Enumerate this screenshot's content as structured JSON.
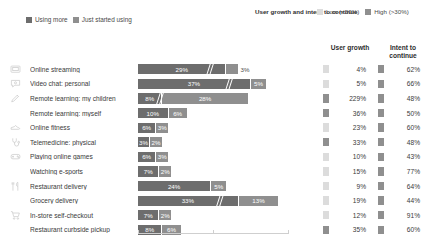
{
  "legend_left": {
    "items": [
      {
        "label": "Using more",
        "color": "#6d6d6d"
      },
      {
        "label": "Just started using",
        "color": "#8f8f8f"
      }
    ]
  },
  "legend_right": {
    "title": "User growth and intent to continue",
    "items": [
      {
        "label": "Low (<30%)",
        "color": "#dcdcdc"
      },
      {
        "label": "High (>30%)",
        "color": "#8f8f8f"
      }
    ]
  },
  "columns": {
    "growth_header": "User growth",
    "intent_header": "Intent to continue"
  },
  "chart_data": {
    "type": "bar",
    "title": "",
    "subtitle": "",
    "xlabel": "",
    "ylabel": "",
    "grid": false,
    "legend_position": "top-left",
    "orientation": "horizontal",
    "stacked": true,
    "axis_break": true,
    "series": [
      {
        "name": "Using more",
        "color": "#6d6d6d"
      },
      {
        "name": "Just started using",
        "color": "#8f8f8f"
      }
    ],
    "categories": [
      "Online streaming",
      "Video chat: personal",
      "Remote learning: my children",
      "Remote learning: myself",
      "Online fitness",
      "Telemedicine: physical",
      "Playing online games",
      "Watching e-sports",
      "Restaurant delivery",
      "Grocery delivery",
      "In-store self-checkout",
      "Restaurant curbside pickup"
    ],
    "rows": [
      {
        "category": "Online streaming",
        "icon": "monitor-icon",
        "using_more": "29%",
        "just_started": "3%",
        "using_more_value": 29,
        "just_started_value": 3,
        "user_growth": "4%",
        "user_growth_value": 4,
        "user_growth_level": "low",
        "intent": "62%",
        "intent_value": 62,
        "intent_level": "high"
      },
      {
        "category": "Video chat: personal",
        "icon": "chat-bubble-icon",
        "using_more": "37%",
        "just_started": "5%",
        "using_more_value": 37,
        "just_started_value": 5,
        "user_growth": "5%",
        "user_growth_value": 5,
        "user_growth_level": "low",
        "intent": "66%",
        "intent_value": 66,
        "intent_level": "high"
      },
      {
        "category": "Remote learning: my children",
        "icon": "pencil-icon",
        "using_more": "8%",
        "just_started": "28%",
        "using_more_value": 8,
        "just_started_value": 28,
        "user_growth": "229%",
        "user_growth_value": 229,
        "user_growth_level": "high",
        "intent": "48%",
        "intent_value": 48,
        "intent_level": "high"
      },
      {
        "category": "Remote learning: myself",
        "icon": "pencil-icon",
        "using_more": "10%",
        "just_started": "6%",
        "using_more_value": 10,
        "just_started_value": 6,
        "user_growth": "36%",
        "user_growth_value": 36,
        "user_growth_level": "high",
        "intent": "50%",
        "intent_value": 50,
        "intent_level": "high"
      },
      {
        "category": "Online fitness",
        "icon": "shoe-icon",
        "using_more": "6%",
        "just_started": "3%",
        "using_more_value": 6,
        "just_started_value": 3,
        "user_growth": "23%",
        "user_growth_value": 23,
        "user_growth_level": "low",
        "intent": "60%",
        "intent_value": 60,
        "intent_level": "high"
      },
      {
        "category": "Telemedicine: physical",
        "icon": "stethoscope-icon",
        "using_more": "3%",
        "just_started": "2%",
        "using_more_value": 3,
        "just_started_value": 2,
        "user_growth": "33%",
        "user_growth_value": 33,
        "user_growth_level": "high",
        "intent": "48%",
        "intent_value": 48,
        "intent_level": "high"
      },
      {
        "category": "Playing online games",
        "icon": "game-controller-icon",
        "using_more": "6%",
        "just_started": "3%",
        "using_more_value": 6,
        "just_started_value": 3,
        "user_growth": "10%",
        "user_growth_value": 10,
        "user_growth_level": "low",
        "intent": "43%",
        "intent_value": 43,
        "intent_level": "high"
      },
      {
        "category": "Watching e-sports",
        "icon": "game-controller-icon",
        "using_more": "7%",
        "just_started": "2%",
        "using_more_value": 7,
        "just_started_value": 2,
        "user_growth": "15%",
        "user_growth_value": 15,
        "user_growth_level": "low",
        "intent": "77%",
        "intent_value": 77,
        "intent_level": "high"
      },
      {
        "category": "Restaurant delivery",
        "icon": "cutlery-icon",
        "using_more": "24%",
        "just_started": "5%",
        "using_more_value": 24,
        "just_started_value": 5,
        "user_growth": "9%",
        "user_growth_value": 9,
        "user_growth_level": "low",
        "intent": "64%",
        "intent_value": 64,
        "intent_level": "high"
      },
      {
        "category": "Grocery delivery",
        "icon": "cutlery-icon",
        "using_more": "33%",
        "just_started": "13%",
        "using_more_value": 33,
        "just_started_value": 13,
        "user_growth": "19%",
        "user_growth_value": 19,
        "user_growth_level": "low",
        "intent": "44%",
        "intent_value": 44,
        "intent_level": "high"
      },
      {
        "category": "In-store self-checkout",
        "icon": "shopping-cart-icon",
        "using_more": "7%",
        "just_started": "2%",
        "using_more_value": 7,
        "just_started_value": 2,
        "user_growth": "12%",
        "user_growth_value": 12,
        "user_growth_level": "low",
        "intent": "91%",
        "intent_value": 91,
        "intent_level": "high"
      },
      {
        "category": "Restaurant curbside pickup",
        "icon": "shopping-cart-icon",
        "using_more": "8%",
        "just_started": "6%",
        "using_more_value": 8,
        "just_started_value": 6,
        "user_growth": "35%",
        "user_growth_value": 35,
        "user_growth_level": "high",
        "intent": "60%",
        "intent_value": 60,
        "intent_level": "high"
      }
    ],
    "colors": {
      "using_more": "#6d6d6d",
      "just_started": "#8f8f8f",
      "low": "#dcdcdc",
      "high": "#8f8f8f"
    }
  }
}
